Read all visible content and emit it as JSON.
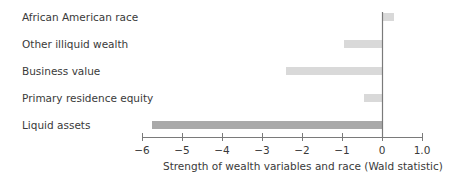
{
  "chart_data": {
    "type": "bar",
    "orientation": "horizontal",
    "title": "",
    "xlabel": "Strength of wealth variables and race (Wald statistic)",
    "ylabel": "",
    "xlim": [
      -6,
      1.0
    ],
    "grid": false,
    "legend": null,
    "categories": [
      "African American race",
      "Other illiquid wealth",
      "Business value",
      "Primary residence equity",
      "Liquid assets"
    ],
    "values": [
      0.3,
      -0.95,
      -2.4,
      -0.45,
      -5.75
    ],
    "bar_colors": [
      "#d9d9d9",
      "#d9d9d9",
      "#d9d9d9",
      "#d9d9d9",
      "#a9a9a9"
    ],
    "x_ticks": [
      {
        "value": -6,
        "label": "−6"
      },
      {
        "value": -5,
        "label": "−5"
      },
      {
        "value": -4,
        "label": "−4"
      },
      {
        "value": -3,
        "label": "−3"
      },
      {
        "value": -2,
        "label": "−2"
      },
      {
        "value": -1,
        "label": "−1"
      },
      {
        "value": 0,
        "label": "0"
      },
      {
        "value": 1,
        "label": "1.0"
      }
    ]
  }
}
